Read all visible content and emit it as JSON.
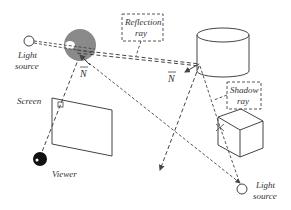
{
  "diagram": {
    "type": "ray-tracing-illustration",
    "labels": {
      "light_source_left_line1": "Light",
      "light_source_left_line2": "source",
      "light_source_right_line1": "Light",
      "light_source_right_line2": "source",
      "reflection_ray_line1": "Reflection",
      "reflection_ray_line2": "ray",
      "shadow_ray_line1": "Shadow",
      "shadow_ray_line2": "ray",
      "normal_sphere": "N",
      "normal_cylinder": "N",
      "screen": "Screen",
      "viewer": "Viewer"
    },
    "objects": [
      "sphere",
      "cylinder",
      "cube",
      "screen",
      "viewer-eye",
      "light-source-left",
      "light-source-right"
    ],
    "colors": {
      "sphere_fill": "#8a8a8a",
      "line": "#444444",
      "text": "#333333",
      "viewer_fill": "#111111"
    }
  }
}
